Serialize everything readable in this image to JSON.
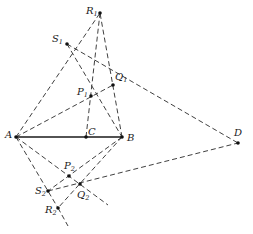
{
  "figure": {
    "type": "projective-geometry-construction",
    "points": {
      "R1": {
        "label": "R",
        "sub": "1",
        "x": 100,
        "y": 13,
        "lx": 86,
        "ly": 14
      },
      "S1": {
        "label": "S",
        "sub": "1",
        "x": 67,
        "y": 44,
        "lx": 52,
        "ly": 42
      },
      "Q1": {
        "label": "Q",
        "sub": "1",
        "x": 113,
        "y": 85,
        "lx": 115,
        "ly": 80
      },
      "P1": {
        "label": "P",
        "sub": "1",
        "x": 91,
        "y": 96,
        "lx": 77,
        "ly": 95
      },
      "A": {
        "label": "A",
        "sub": "",
        "x": 16,
        "y": 137,
        "lx": 5,
        "ly": 138
      },
      "C": {
        "label": "C",
        "sub": "",
        "x": 86,
        "y": 137,
        "lx": 88,
        "ly": 135
      },
      "B": {
        "label": "B",
        "sub": "",
        "x": 122,
        "y": 137,
        "lx": 127,
        "ly": 141
      },
      "D": {
        "label": "D",
        "sub": "",
        "x": 238,
        "y": 143,
        "lx": 234,
        "ly": 136
      },
      "P2": {
        "label": "P",
        "sub": "2",
        "x": 69,
        "y": 176,
        "lx": 64,
        "ly": 169
      },
      "Q2": {
        "label": "Q",
        "sub": "2",
        "x": 80,
        "y": 184,
        "lx": 77,
        "ly": 198
      },
      "S2": {
        "label": "S",
        "sub": "2",
        "x": 48,
        "y": 191,
        "lx": 35,
        "ly": 194
      },
      "R2": {
        "label": "R",
        "sub": "2",
        "x": 58,
        "y": 208,
        "lx": 45,
        "ly": 213
      }
    },
    "solid_segments": [
      [
        "A",
        "B"
      ]
    ],
    "dashed_lines": [
      {
        "x1": 16,
        "y1": 137,
        "x2": 100,
        "y2": 13
      },
      {
        "x1": 122,
        "y1": 137,
        "x2": 100,
        "y2": 13
      },
      {
        "x1": 86,
        "y1": 137,
        "x2": 100,
        "y2": 13
      },
      {
        "x1": 67,
        "y1": 44,
        "x2": 238,
        "y2": 143
      },
      {
        "x1": 67,
        "y1": 44,
        "x2": 122,
        "y2": 137
      },
      {
        "x1": 16,
        "y1": 137,
        "x2": 113,
        "y2": 85
      },
      {
        "x1": 16,
        "y1": 137,
        "x2": 58,
        "y2": 208
      },
      {
        "x1": 58,
        "y1": 208,
        "x2": 68,
        "y2": 226
      },
      {
        "x1": 16,
        "y1": 137,
        "x2": 108,
        "y2": 205
      },
      {
        "x1": 122,
        "y1": 137,
        "x2": 48,
        "y2": 191
      },
      {
        "x1": 122,
        "y1": 137,
        "x2": 58,
        "y2": 208
      },
      {
        "x1": 48,
        "y1": 191,
        "x2": 238,
        "y2": 143
      }
    ]
  }
}
